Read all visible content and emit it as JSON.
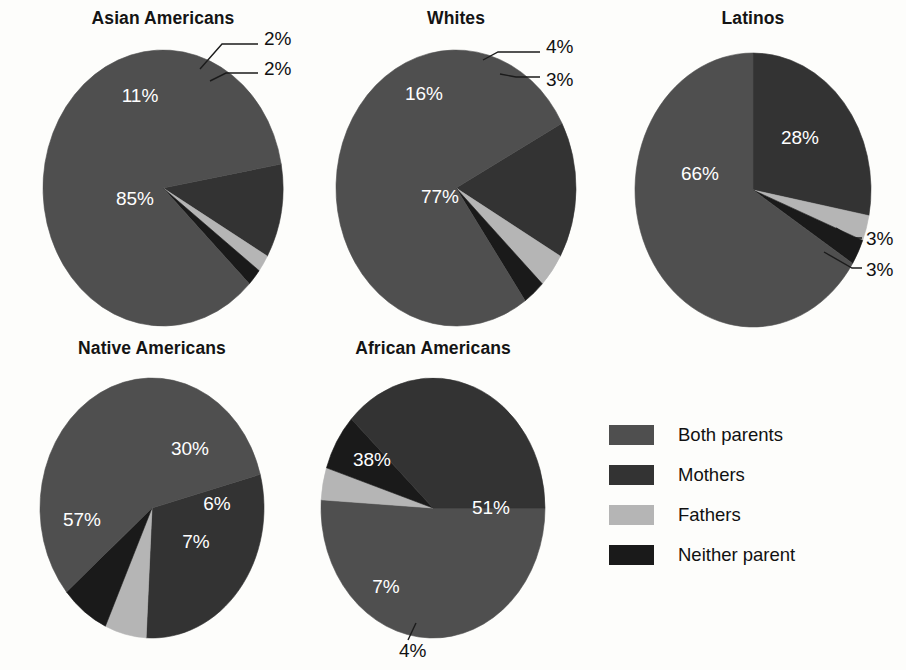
{
  "figure": {
    "background": "#fdfdfb",
    "label_suffix": "%"
  },
  "legend": {
    "title": "",
    "items": [
      {
        "label": "Both parents",
        "color": "#4f4f4f",
        "key": "both"
      },
      {
        "label": "Mothers",
        "color": "#333333",
        "key": "mothers"
      },
      {
        "label": "Fathers",
        "color": "#b5b5b5",
        "key": "fathers"
      },
      {
        "label": "Neither parent",
        "color": "#1a1a1a",
        "key": "neither"
      }
    ]
  },
  "chart_data": {
    "type": "pie",
    "title": "",
    "series_labels": [
      "Both parents",
      "Mothers",
      "Fathers",
      "Neither parent"
    ],
    "colors": {
      "both": "#4f4f4f",
      "mothers": "#333333",
      "fathers": "#b5b5b5",
      "neither": "#1a1a1a"
    },
    "charts": [
      {
        "name": "Asian Americans",
        "title": "Asian Americans",
        "cx": 163,
        "cy": 188,
        "rx": 120,
        "ry": 138,
        "start_angle": -10,
        "slices": [
          {
            "key": "mothers",
            "label": "11%",
            "value": 11,
            "color": "#333333",
            "inside": true,
            "lx": 140,
            "ly": 97
          },
          {
            "key": "fathers",
            "label": "2%",
            "value": 2,
            "color": "#b5b5b5",
            "inside": false,
            "lx": 264,
            "ly": 40,
            "leader": "M 200,69 L 222,44 L 258,44"
          },
          {
            "key": "neither",
            "label": "2%",
            "value": 2,
            "color": "#1a1a1a",
            "inside": false,
            "lx": 264,
            "ly": 70,
            "leader": "M 210,81 L 226,73 L 258,73"
          },
          {
            "key": "both",
            "label": "85%",
            "value": 85,
            "color": "#4f4f4f",
            "inside": true,
            "lx": 135,
            "ly": 200
          }
        ]
      },
      {
        "name": "Whites",
        "title": "Whites",
        "cx": 456,
        "cy": 188,
        "rx": 120,
        "ry": 138,
        "start_angle": -28,
        "slices": [
          {
            "key": "mothers",
            "label": "16%",
            "value": 16,
            "color": "#333333",
            "inside": true,
            "lx": 424,
            "ly": 95
          },
          {
            "key": "fathers",
            "label": "4%",
            "value": 4,
            "color": "#b5b5b5",
            "inside": false,
            "lx": 546,
            "ly": 48,
            "leader": "M 483,60 L 498,52 L 540,52"
          },
          {
            "key": "neither",
            "label": "3%",
            "value": 3,
            "color": "#1a1a1a",
            "inside": false,
            "lx": 546,
            "ly": 81,
            "leader": "M 500,74 L 516,77 L 540,77"
          },
          {
            "key": "both",
            "label": "77%",
            "value": 77,
            "color": "#4f4f4f",
            "inside": true,
            "lx": 440,
            "ly": 198
          }
        ]
      },
      {
        "name": "Latinos",
        "title": "Latinos",
        "cx": 753,
        "cy": 190,
        "rx": 118,
        "ry": 137,
        "start_angle": -90,
        "slices": [
          {
            "key": "mothers",
            "label": "28%",
            "value": 28,
            "color": "#333333",
            "inside": true,
            "lx": 800,
            "ly": 139
          },
          {
            "key": "fathers",
            "label": "3%",
            "value": 3,
            "color": "#b5b5b5",
            "inside": false,
            "lx": 866,
            "ly": 240,
            "leader": "M 836,228 L 852,238 L 862,238"
          },
          {
            "key": "neither",
            "label": "3%",
            "value": 3,
            "color": "#1a1a1a",
            "inside": false,
            "lx": 866,
            "ly": 271,
            "leader": "M 824,252 L 852,268 L 862,268"
          },
          {
            "key": "both",
            "label": "66%",
            "value": 66,
            "color": "#4f4f4f",
            "inside": true,
            "lx": 700,
            "ly": 175
          }
        ]
      },
      {
        "name": "Native Americans",
        "title": "Native Americans",
        "cx": 152,
        "cy": 508,
        "rx": 112,
        "ry": 130,
        "start_angle": -15,
        "slices": [
          {
            "key": "mothers",
            "label": "30%",
            "value": 30,
            "color": "#333333",
            "inside": true,
            "lx": 190,
            "ly": 450
          },
          {
            "key": "fathers",
            "label": "6%",
            "value": 6,
            "color": "#b5b5b5",
            "inside": true,
            "lx": 217,
            "ly": 505
          },
          {
            "key": "neither",
            "label": "7%",
            "value": 7,
            "color": "#1a1a1a",
            "inside": true,
            "lx": 196,
            "ly": 543
          },
          {
            "key": "both",
            "label": "57%",
            "value": 57,
            "color": "#4f4f4f",
            "inside": true,
            "lx": 82,
            "ly": 521
          }
        ]
      },
      {
        "name": "African Americans",
        "title": "African Americans",
        "cx": 433,
        "cy": 508,
        "rx": 112,
        "ry": 130,
        "start_angle": 0,
        "slices": [
          {
            "key": "both",
            "label": "51%",
            "value": 51,
            "color": "#4f4f4f",
            "inside": true,
            "lx": 491,
            "ly": 509
          },
          {
            "key": "fathers",
            "label": "4%",
            "value": 4,
            "color": "#b5b5b5",
            "inside": false,
            "lx": 399,
            "ly": 652,
            "leader": "M 416,623 L 408,640"
          },
          {
            "key": "neither",
            "label": "7%",
            "value": 7,
            "color": "#1a1a1a",
            "inside": true,
            "lx": 386,
            "ly": 588
          },
          {
            "key": "mothers",
            "label": "38%",
            "value": 38,
            "color": "#333333",
            "inside": true,
            "lx": 372,
            "ly": 461
          }
        ]
      }
    ]
  },
  "titles": {
    "asian": "Asian Americans",
    "whites": "Whites",
    "latinos": "Latinos",
    "native": "Native Americans",
    "african": "African Americans"
  }
}
